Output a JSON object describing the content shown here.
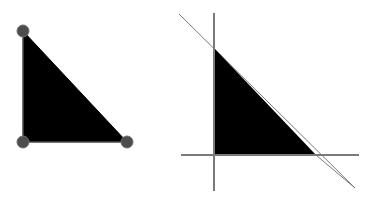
{
  "figure": {
    "title": "",
    "background_color": "#ffffff",
    "canvas_width": 374,
    "canvas_height": 205
  },
  "chart_data": {
    "type": "scatter",
    "title": "",
    "xlabel": "",
    "ylabel": "",
    "grid": false,
    "legend": null,
    "xlim": [
      0,
      374
    ],
    "ylim": [
      205,
      0
    ],
    "panels": [
      {
        "name": "left-panel-triangle-with-vertices",
        "description": "Filled black right triangle with gray circular vertex markers at each corner",
        "polygon": {
          "fill_color": "#000000",
          "stroke_color": "#000000",
          "stroke_width": 1,
          "points": [
            {
              "label": "A",
              "x": 23,
              "y": 31
            },
            {
              "label": "B",
              "x": 23,
              "y": 142
            },
            {
              "label": "C",
              "x": 127,
              "y": 142
            }
          ]
        },
        "vertex_markers": {
          "shape": "circle",
          "radius": 6,
          "fill_color": "#4d4d4d",
          "stroke_color": "#6e6e6e",
          "stroke_width": 1,
          "positions": [
            {
              "label": "A",
              "x": 23,
              "y": 31
            },
            {
              "label": "B",
              "x": 23,
              "y": 142
            },
            {
              "label": "C",
              "x": 127,
              "y": 142
            }
          ]
        },
        "edges": [
          {
            "label": "AB",
            "from": "A",
            "to": "B",
            "orientation": "vertical"
          },
          {
            "label": "BC",
            "from": "B",
            "to": "C",
            "orientation": "horizontal"
          },
          {
            "label": "CA",
            "from": "C",
            "to": "A",
            "orientation": "diagonal"
          }
        ]
      },
      {
        "name": "right-panel-triangle-with-extended-lines",
        "description": "Same filled black right triangle with each of its three edges extended as long gray lines beyond the vertices",
        "polygon": {
          "fill_color": "#000000",
          "stroke_color": "#000000",
          "stroke_width": 0,
          "points": [
            {
              "label": "A",
              "x": 214,
              "y": 48
            },
            {
              "label": "B",
              "x": 214,
              "y": 155
            },
            {
              "label": "C",
              "x": 316,
              "y": 155
            }
          ]
        },
        "extended_lines": [
          {
            "label": "line-AB-vertical",
            "color": "#7a7a7a",
            "width": 2,
            "x1": 214,
            "y1": 13,
            "x2": 214,
            "y2": 191
          },
          {
            "label": "line-BC-horizontal",
            "color": "#7a7a7a",
            "width": 2,
            "x1": 181,
            "y1": 155,
            "x2": 359,
            "y2": 155
          },
          {
            "label": "line-CA-diagonal",
            "color": "#7a7a7a",
            "width": 1,
            "x1": 179,
            "y1": 14,
            "x2": 355,
            "y2": 188
          }
        ]
      }
    ]
  }
}
